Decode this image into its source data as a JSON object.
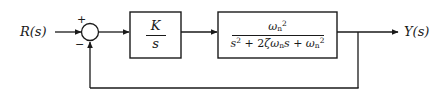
{
  "diagram": {
    "line_color": "#1a1a1a",
    "background": "#ffffff",
    "input_signal": "R(s)",
    "output_signal": "Y(s)",
    "summing_junction": {
      "plus_sign": "+",
      "minus_sign": "−"
    },
    "blocks": [
      {
        "id": "controller",
        "numerator": "K",
        "denominator": "s",
        "expression": "K/s"
      },
      {
        "id": "plant",
        "numerator_base": "ω",
        "numerator_sub": "n",
        "numerator_sup": "2",
        "denominator": "s² + 2ζωₙs + ωₙ²",
        "expression": "ωₙ²/(s² + 2ζωₙs + ωₙ²)",
        "den_s": "s",
        "den_sup2": "2",
        "den_plus": "+",
        "den_two": "2",
        "den_zeta": "ζ",
        "den_omega": "ω",
        "den_n": "n",
        "den_s2": "s",
        "den_plus2": "+",
        "den_omega2": "ω",
        "den_n2": "n",
        "den_sup22": "2"
      }
    ],
    "feedback": {
      "type": "unity",
      "label": ""
    }
  }
}
